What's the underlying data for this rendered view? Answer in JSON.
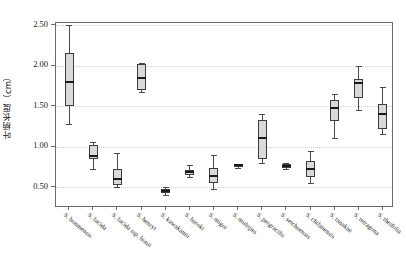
{
  "chart_data": {
    "type": "box",
    "title": "",
    "xlabel": "",
    "ylabel": "叶柄长度（cm）",
    "ylim": [
      0.13,
      2.65
    ],
    "yticks": [
      0.5,
      1.0,
      1.5,
      2.0,
      2.5
    ],
    "ytick_labels": [
      "0.50",
      "1.00",
      "1.50",
      "2.00",
      "2.50"
    ],
    "grid": "horizontal-dotted",
    "legend": "none",
    "categories": [
      "S. boniiínsis",
      "S. lucida",
      "S. lucida ssp. bonii",
      "S. henryi",
      "S. kawakamii",
      "S. baroki",
      "S. migoi",
      "S. multipes",
      "S. pergracilis",
      "S. setchuensis",
      "S. chilanensis",
      "S. tanakae",
      "S. tetragona",
      "S. theifolia"
    ],
    "boxes": [
      {
        "label": "S. bonmensis",
        "whisker_low": 1.28,
        "q1": 1.5,
        "median": 1.8,
        "q3": 2.15,
        "whisker_high": 2.5
      },
      {
        "label": "S. lucida",
        "whisker_low": 0.72,
        "q1": 0.84,
        "median": 0.88,
        "q3": 1.02,
        "whisker_high": 1.05
      },
      {
        "label": "S. lucida ssp. bonii",
        "whisker_low": 0.5,
        "q1": 0.53,
        "median": 0.6,
        "q3": 0.72,
        "whisker_high": 0.92
      },
      {
        "label": "S. henryi",
        "whisker_low": 1.67,
        "q1": 1.7,
        "median": 1.85,
        "q3": 2.02,
        "whisker_high": 2.03
      },
      {
        "label": "S. kawakamii",
        "whisker_low": 0.4,
        "q1": 0.43,
        "median": 0.45,
        "q3": 0.47,
        "whisker_high": 0.5
      },
      {
        "label": "S. baroki",
        "whisker_low": 0.62,
        "q1": 0.65,
        "median": 0.68,
        "q3": 0.71,
        "whisker_high": 0.77
      },
      {
        "label": "S. migoi",
        "whisker_low": 0.48,
        "q1": 0.55,
        "median": 0.63,
        "q3": 0.73,
        "whisker_high": 0.9
      },
      {
        "label": "S. multipes",
        "whisker_low": 0.73,
        "q1": 0.75,
        "median": 0.77,
        "q3": 0.78,
        "whisker_high": 0.79
      },
      {
        "label": "S. pergracilis",
        "whisker_low": 0.8,
        "q1": 0.85,
        "median": 1.1,
        "q3": 1.33,
        "whisker_high": 1.4
      },
      {
        "label": "S. setchuensis",
        "whisker_low": 0.72,
        "q1": 0.74,
        "median": 0.76,
        "q3": 0.78,
        "whisker_high": 0.8
      },
      {
        "label": "S. chilanensis",
        "whisker_low": 0.55,
        "q1": 0.62,
        "median": 0.72,
        "q3": 0.82,
        "whisker_high": 0.95
      },
      {
        "label": "S. tanakae",
        "whisker_low": 1.1,
        "q1": 1.32,
        "median": 1.47,
        "q3": 1.58,
        "whisker_high": 1.65
      },
      {
        "label": "S. tetragona",
        "whisker_low": 1.45,
        "q1": 1.6,
        "median": 1.78,
        "q3": 1.83,
        "whisker_high": 2.0
      },
      {
        "label": "S. theifolia",
        "whisker_low": 1.15,
        "q1": 1.22,
        "median": 1.4,
        "q3": 1.52,
        "whisker_high": 1.73
      }
    ]
  },
  "style": {
    "box_fill": "#d9d9d9",
    "box_stroke": "#3d3d3d",
    "median_color": "#1a1a1a",
    "whisker_color": "#4a4a4a",
    "grid_color": "#cfcfcf",
    "frame_color": "#6b6b6b",
    "background": "#ffffff"
  }
}
